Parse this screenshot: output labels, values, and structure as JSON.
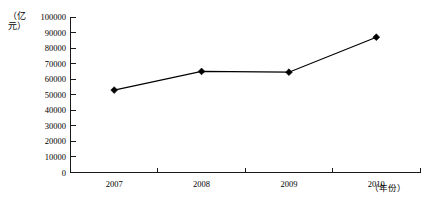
{
  "chart_data": {
    "type": "line",
    "title": "",
    "subtitle": "",
    "xlabel": "（年份）",
    "ylabel": "（亿元）",
    "categories": [
      "2007",
      "2008",
      "2009",
      "2010"
    ],
    "values": [
      53000,
      65000,
      64500,
      87000
    ],
    "series": [
      {
        "name": "",
        "values": [
          53000,
          65000,
          64500,
          87000
        ]
      }
    ],
    "ylim": [
      0,
      100000
    ],
    "ytick_step": 10000,
    "ytick_labels": [
      "0",
      "10000",
      "20000",
      "30000",
      "40000",
      "50000",
      "60000",
      "70000",
      "80000",
      "90000",
      "100000"
    ],
    "grid": false,
    "legend": false,
    "legend_position": "none",
    "marker_shape": "diamond",
    "line_color": "#000000",
    "marker_color": "#000000",
    "axis_color": "#1a1a1a",
    "background_color": "#ffffff",
    "annotations": []
  },
  "axes": {
    "y_axis_title_chars": [
      "（",
      "亿",
      "元",
      "）"
    ],
    "x_axis_title": "（年份）"
  }
}
